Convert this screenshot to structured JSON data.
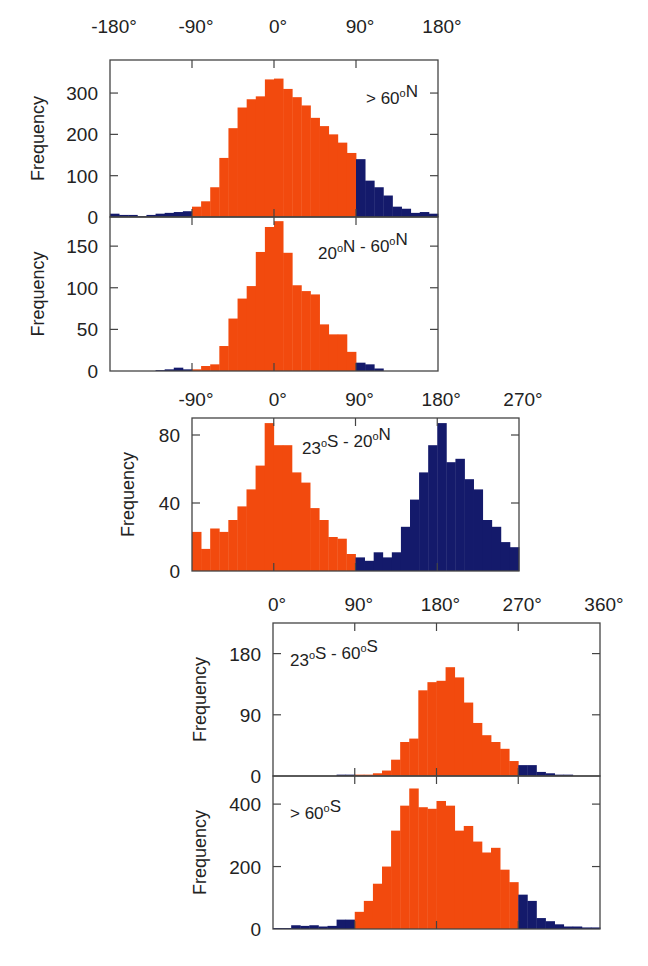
{
  "colors": {
    "in_phase": "#F24A0E",
    "out_phase": "#141A6B",
    "axis": "#444444",
    "text": "#222222"
  },
  "chart_data": [
    {
      "type": "bar",
      "title": "> 60°N",
      "annotation": "> 60°N",
      "xlabel": "",
      "ylabel": "Frequency",
      "top_axis_ticks": [
        "-180°",
        "-90°",
        "0°",
        "90°",
        "180°"
      ],
      "show_top_axis_labels": true,
      "x_range": [
        -180,
        180
      ],
      "bin_width": 10,
      "ylim": [
        0,
        380
      ],
      "yticks": [
        0,
        100,
        200,
        300
      ],
      "highlight_range": [
        -90,
        90
      ],
      "bin_starts": [
        -180,
        -170,
        -160,
        -150,
        -140,
        -130,
        -120,
        -110,
        -100,
        -90,
        -80,
        -70,
        -60,
        -50,
        -40,
        -30,
        -20,
        -10,
        0,
        10,
        20,
        30,
        40,
        50,
        60,
        70,
        80,
        90,
        100,
        110,
        120,
        130,
        140,
        150,
        160,
        170
      ],
      "values": [
        8,
        5,
        5,
        2,
        5,
        8,
        10,
        12,
        14,
        25,
        38,
        72,
        143,
        215,
        265,
        285,
        292,
        333,
        335,
        310,
        290,
        270,
        240,
        220,
        200,
        180,
        155,
        140,
        88,
        72,
        52,
        25,
        20,
        10,
        12,
        8
      ]
    },
    {
      "type": "bar",
      "title": "20°N - 60°N",
      "annotation": "20°N - 60°N",
      "xlabel": "",
      "ylabel": "Frequency",
      "top_axis_ticks": [],
      "show_top_axis_labels": false,
      "x_range": [
        -180,
        180
      ],
      "bin_width": 10,
      "ylim": [
        0,
        185
      ],
      "yticks": [
        0,
        50,
        100,
        150
      ],
      "highlight_range": [
        -90,
        90
      ],
      "bin_starts": [
        -180,
        -170,
        -160,
        -150,
        -140,
        -130,
        -120,
        -110,
        -100,
        -90,
        -80,
        -70,
        -60,
        -50,
        -40,
        -30,
        -20,
        -10,
        0,
        10,
        20,
        30,
        40,
        50,
        60,
        70,
        80,
        90,
        100,
        110,
        120,
        130,
        140,
        150,
        160,
        170
      ],
      "values": [
        0,
        0,
        0,
        0,
        0,
        1,
        2,
        4,
        2,
        2,
        6,
        8,
        30,
        63,
        87,
        102,
        143,
        173,
        180,
        142,
        103,
        96,
        92,
        56,
        44,
        44,
        23,
        10,
        8,
        3,
        0,
        0,
        0,
        0,
        0,
        0
      ]
    },
    {
      "type": "bar",
      "title": "23°S - 20°N",
      "annotation": "23°S - 20°N",
      "xlabel": "",
      "ylabel": "Frequency",
      "top_axis_ticks": [
        "-90°",
        "0°",
        "90°",
        "180°",
        "270°"
      ],
      "show_top_axis_labels": true,
      "x_range": [
        -90,
        270
      ],
      "bin_width": 10,
      "ylim": [
        0,
        90
      ],
      "yticks": [
        0,
        40,
        80
      ],
      "highlight_range": [
        -90,
        90
      ],
      "bin_starts": [
        -90,
        -80,
        -70,
        -60,
        -50,
        -40,
        -30,
        -20,
        -10,
        0,
        10,
        20,
        30,
        40,
        50,
        60,
        70,
        80,
        90,
        100,
        110,
        120,
        130,
        140,
        150,
        160,
        170,
        180,
        190,
        200,
        210,
        220,
        230,
        240,
        250,
        260
      ],
      "values": [
        23,
        13,
        25,
        23,
        30,
        38,
        48,
        62,
        87,
        74,
        74,
        58,
        52,
        37,
        30,
        20,
        19,
        10,
        8,
        6,
        11,
        8,
        11,
        26,
        42,
        58,
        74,
        87,
        64,
        66,
        54,
        48,
        30,
        26,
        17,
        14
      ]
    },
    {
      "type": "bar",
      "title": "23°S - 60°S",
      "annotation": "23°S - 60°S",
      "xlabel": "",
      "ylabel": "Frequency",
      "top_axis_ticks": [
        "0°",
        "90°",
        "180°",
        "270°",
        "360°"
      ],
      "show_top_axis_labels": true,
      "x_range": [
        0,
        360
      ],
      "bin_width": 10,
      "ylim": [
        0,
        225
      ],
      "yticks": [
        0,
        90,
        180
      ],
      "highlight_range": [
        90,
        270
      ],
      "bin_starts": [
        0,
        10,
        20,
        30,
        40,
        50,
        60,
        70,
        80,
        90,
        100,
        110,
        120,
        130,
        140,
        150,
        160,
        170,
        180,
        190,
        200,
        210,
        220,
        230,
        240,
        250,
        260,
        270,
        280,
        290,
        300,
        310,
        320,
        330,
        340,
        350
      ],
      "values": [
        0,
        0,
        0,
        0,
        0,
        0,
        0,
        2,
        2,
        2,
        2,
        4,
        8,
        24,
        50,
        55,
        126,
        138,
        140,
        160,
        145,
        108,
        78,
        60,
        50,
        40,
        22,
        16,
        16,
        6,
        4,
        2,
        2,
        0,
        0,
        0
      ]
    },
    {
      "type": "bar",
      "title": "> 60°S",
      "annotation": "> 60°S",
      "xlabel": "",
      "ylabel": "Frequency",
      "top_axis_ticks": [],
      "show_top_axis_labels": false,
      "x_range": [
        0,
        360
      ],
      "bin_width": 10,
      "ylim": [
        0,
        490
      ],
      "yticks": [
        0,
        200,
        400
      ],
      "highlight_range": [
        90,
        270
      ],
      "bin_starts": [
        0,
        10,
        20,
        30,
        40,
        50,
        60,
        70,
        80,
        90,
        100,
        110,
        120,
        130,
        140,
        150,
        160,
        170,
        180,
        190,
        200,
        210,
        220,
        230,
        240,
        250,
        260,
        270,
        280,
        290,
        300,
        310,
        320,
        330,
        340,
        350
      ],
      "values": [
        3,
        3,
        12,
        10,
        12,
        8,
        10,
        30,
        30,
        55,
        90,
        145,
        200,
        315,
        395,
        450,
        390,
        385,
        410,
        395,
        315,
        330,
        280,
        245,
        260,
        190,
        150,
        110,
        90,
        35,
        25,
        15,
        8,
        8,
        5,
        5
      ]
    }
  ],
  "panels": [
    {
      "annotation_main": "> 60",
      "annotation_sup": "o",
      "annotation_tail": "N"
    },
    {
      "annotation_main": "20",
      "annotation_sup": "o",
      "annotation_tail": "N - 60",
      "annotation_sup2": "o",
      "annotation_tail2": "N"
    },
    {
      "annotation_main": "23",
      "annotation_sup": "o",
      "annotation_tail": "S - 20",
      "annotation_sup2": "o",
      "annotation_tail2": "N"
    },
    {
      "annotation_main": "23",
      "annotation_sup": "o",
      "annotation_tail": "S - 60",
      "annotation_sup2": "o",
      "annotation_tail2": "S"
    },
    {
      "annotation_main": "> 60",
      "annotation_sup": "o",
      "annotation_tail": "S"
    }
  ]
}
